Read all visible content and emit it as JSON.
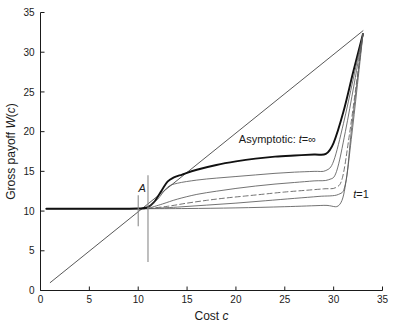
{
  "chart_data": {
    "type": "line",
    "title": "",
    "xlabel": "Cost c",
    "xlabel_plain": "Cost",
    "xlabel_italic": "c",
    "ylabel": "Gross payoff W(c)",
    "ylabel_plain": "Gross payoff ",
    "ylabel_italic_w": "W",
    "ylabel_paren_open": "(",
    "ylabel_italic_c": "c",
    "ylabel_paren_close": ")",
    "xlim": [
      0,
      35
    ],
    "ylim": [
      0,
      35
    ],
    "xticks": [
      0,
      5,
      10,
      15,
      20,
      25,
      30,
      35
    ],
    "yticks": [
      0,
      5,
      10,
      15,
      20,
      25,
      30,
      35
    ],
    "xticklabels": [
      "0",
      "5",
      "10",
      "15",
      "20",
      "25",
      "30",
      "35"
    ],
    "yticklabels": [
      "0",
      "5",
      "10",
      "15",
      "20",
      "25",
      "30",
      "35"
    ],
    "grid": false,
    "legend_position": "inline-annotations",
    "annotations": [
      {
        "name": "asymptotic-label",
        "text_plain": "Asymptotic: ",
        "text_italic": "t",
        "text_rest": "=∞",
        "x": 20.3,
        "y": 18.6
      },
      {
        "name": "t1-label",
        "text_italic": "t",
        "text_rest": "=1",
        "x": 32.0,
        "y": 11.6
      },
      {
        "name": "point-a-label",
        "text_italic": "A",
        "x": 10.4,
        "y": 12.4
      }
    ],
    "markers": [
      {
        "name": "marker-short-vertical",
        "x": 10.0,
        "y_from": 8.1,
        "y_to": 12.0
      },
      {
        "name": "marker-long-vertical",
        "x": 11.0,
        "y_from": 3.6,
        "y_to": 14.5
      }
    ],
    "series": [
      {
        "name": "diagonal-reference",
        "style": "thin-solid",
        "color": "#3a3a3a",
        "points": [
          [
            1.0,
            1.0
          ],
          [
            33.0,
            32.7
          ]
        ]
      },
      {
        "name": "baseline-horizontal",
        "style": "solid",
        "color": "#4a4a4a",
        "points": [
          [
            0.6,
            10.3
          ],
          [
            10.9,
            10.3
          ]
        ]
      },
      {
        "name": "asymptotic-t-infinity",
        "style": "thick-solid",
        "color": "#111111",
        "points": [
          [
            0.6,
            10.3
          ],
          [
            5.0,
            10.3
          ],
          [
            8.0,
            10.3
          ],
          [
            10.0,
            10.32
          ],
          [
            10.9,
            10.45
          ],
          [
            11.6,
            11.1
          ],
          [
            12.4,
            12.6
          ],
          [
            13.0,
            13.7
          ],
          [
            13.6,
            14.2
          ],
          [
            14.5,
            14.6
          ],
          [
            16.0,
            15.2
          ],
          [
            18.0,
            15.8
          ],
          [
            20.0,
            16.25
          ],
          [
            22.0,
            16.6
          ],
          [
            24.0,
            16.85
          ],
          [
            26.0,
            17.0
          ],
          [
            28.0,
            17.12
          ],
          [
            29.2,
            17.2
          ],
          [
            30.0,
            18.6
          ],
          [
            31.0,
            22.5
          ],
          [
            32.0,
            27.5
          ],
          [
            33.0,
            32.3
          ]
        ]
      },
      {
        "name": "t-curve-upper",
        "style": "thin-solid",
        "color": "#5a5a5a",
        "points": [
          [
            11.0,
            10.35
          ],
          [
            12.0,
            11.5
          ],
          [
            13.0,
            13.0
          ],
          [
            14.0,
            13.5
          ],
          [
            16.0,
            13.9
          ],
          [
            18.0,
            14.15
          ],
          [
            20.0,
            14.35
          ],
          [
            22.0,
            14.55
          ],
          [
            24.0,
            14.75
          ],
          [
            26.0,
            14.9
          ],
          [
            28.0,
            15.0
          ],
          [
            29.2,
            15.1
          ],
          [
            30.0,
            16.3
          ],
          [
            31.0,
            21.0
          ],
          [
            32.0,
            26.6
          ],
          [
            33.0,
            32.3
          ]
        ]
      },
      {
        "name": "t-curve-second",
        "style": "thin-solid",
        "color": "#5a5a5a",
        "points": [
          [
            11.0,
            10.33
          ],
          [
            12.5,
            10.9
          ],
          [
            14.0,
            11.5
          ],
          [
            16.0,
            12.1
          ],
          [
            18.0,
            12.5
          ],
          [
            20.0,
            12.85
          ],
          [
            22.0,
            13.15
          ],
          [
            24.0,
            13.4
          ],
          [
            26.0,
            13.6
          ],
          [
            28.0,
            13.8
          ],
          [
            29.5,
            13.95
          ],
          [
            30.3,
            15.0
          ],
          [
            31.2,
            20.0
          ],
          [
            32.1,
            26.0
          ],
          [
            33.0,
            32.3
          ]
        ]
      },
      {
        "name": "t-curve-dashed",
        "style": "dashed",
        "color": "#5a5a5a",
        "points": [
          [
            11.0,
            10.32
          ],
          [
            13.0,
            10.6
          ],
          [
            15.0,
            11.0
          ],
          [
            17.0,
            11.35
          ],
          [
            19.0,
            11.65
          ],
          [
            21.0,
            11.9
          ],
          [
            23.0,
            12.15
          ],
          [
            25.0,
            12.4
          ],
          [
            27.0,
            12.6
          ],
          [
            29.0,
            12.8
          ],
          [
            30.2,
            12.95
          ],
          [
            30.9,
            14.2
          ],
          [
            31.6,
            19.5
          ],
          [
            32.3,
            25.8
          ],
          [
            33.0,
            32.3
          ]
        ]
      },
      {
        "name": "t-curve-lower",
        "style": "thin-solid",
        "color": "#5a5a5a",
        "points": [
          [
            11.0,
            10.31
          ],
          [
            14.0,
            10.5
          ],
          [
            17.0,
            10.75
          ],
          [
            20.0,
            11.0
          ],
          [
            23.0,
            11.3
          ],
          [
            26.0,
            11.6
          ],
          [
            28.5,
            11.85
          ],
          [
            30.5,
            12.1
          ],
          [
            31.2,
            13.4
          ],
          [
            31.8,
            19.0
          ],
          [
            32.4,
            25.5
          ],
          [
            33.0,
            32.3
          ]
        ]
      },
      {
        "name": "t-curve-t1",
        "style": "thin-solid",
        "color": "#5a5a5a",
        "points": [
          [
            11.0,
            10.3
          ],
          [
            15.0,
            10.32
          ],
          [
            20.0,
            10.4
          ],
          [
            25.0,
            10.55
          ],
          [
            29.0,
            10.72
          ],
          [
            30.6,
            10.8
          ],
          [
            31.3,
            14.0
          ],
          [
            31.8,
            20.0
          ],
          [
            32.4,
            26.3
          ],
          [
            33.0,
            32.3
          ]
        ]
      }
    ]
  }
}
